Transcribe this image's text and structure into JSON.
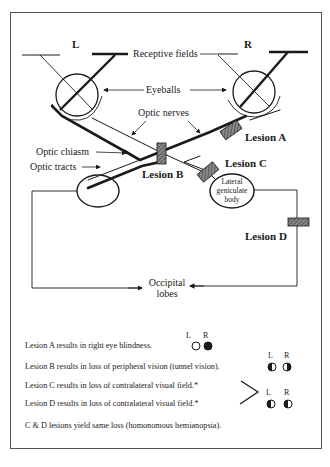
{
  "diagram": {
    "labels": {
      "left_eye": "L",
      "right_eye": "R",
      "receptive_fields": "Receptive fields",
      "eyeballs": "Eyeballs",
      "optic_nerves": "Optic nerves",
      "optic_chiasm": "Optic chiasm",
      "optic_tracts": "Optic tracts",
      "lgb_line1": "Lateral",
      "lgb_line2": "geniculate",
      "lgb_line3": "body",
      "occipital_line1": "Occipital",
      "occipital_line2": "lobes"
    },
    "lesions": [
      {
        "id": "A",
        "label": "Lesion A",
        "location": "right optic nerve"
      },
      {
        "id": "B",
        "label": "Lesion B",
        "location": "optic chiasm"
      },
      {
        "id": "C",
        "label": "Lesion C",
        "location": "right optic tract"
      },
      {
        "id": "D",
        "label": "Lesion D",
        "location": "optic radiation to occipital lobe"
      }
    ],
    "colors": {
      "ink": "#1a1a1a",
      "lesion_fill": "#6b6b6b",
      "frame": "#555555"
    }
  },
  "legend": {
    "col_L": "L",
    "col_R": "R",
    "rows": [
      {
        "text": "Lesion A results in right eye blindness.",
        "L": "empty",
        "R": "full"
      },
      {
        "text": "Lesion B results in loss of peripheral vision (tunnel vision).",
        "L": "left-half",
        "R": "right-half"
      },
      {
        "text": "Lesion C results in loss of contralateral visual field.*",
        "L": "left-half",
        "R": "left-half"
      },
      {
        "text": "Lesion D results in loss of contralateral visual field.*",
        "L": "left-half",
        "R": "left-half"
      }
    ],
    "footnote": "C & D lesions yield same loss (homonomous hemianopsia)."
  }
}
